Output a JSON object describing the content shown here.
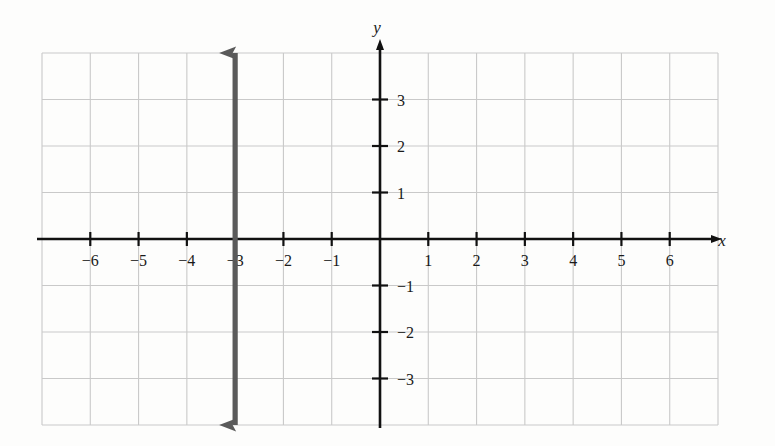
{
  "figure": {
    "kind": "coordinate-plane-graph",
    "background_color": "#fdfdfc",
    "grid_color": "#c9c9c9",
    "axis_color": "#111111",
    "line_color": "#5a5a5a"
  },
  "axes": {
    "x_label": "x",
    "y_label": "y",
    "x_ticks": [
      {
        "value": -6,
        "label": "−6"
      },
      {
        "value": -5,
        "label": "−5"
      },
      {
        "value": -4,
        "label": "−4"
      },
      {
        "value": -3,
        "label": "−3"
      },
      {
        "value": -2,
        "label": "−2"
      },
      {
        "value": -1,
        "label": "−1"
      },
      {
        "value": 1,
        "label": "1"
      },
      {
        "value": 2,
        "label": "2"
      },
      {
        "value": 3,
        "label": "3"
      },
      {
        "value": 4,
        "label": "4"
      },
      {
        "value": 5,
        "label": "5"
      },
      {
        "value": 6,
        "label": "6"
      }
    ],
    "y_ticks": [
      {
        "value": 3,
        "label": "3"
      },
      {
        "value": 2,
        "label": "2"
      },
      {
        "value": 1,
        "label": "1"
      },
      {
        "value": -1,
        "label": "−1"
      },
      {
        "value": -2,
        "label": "−2"
      },
      {
        "value": -3,
        "label": "−3"
      }
    ]
  },
  "chart_data": {
    "type": "line",
    "title": "",
    "xlabel": "x",
    "ylabel": "y",
    "xlim": [
      -7,
      7
    ],
    "ylim": [
      -4,
      4
    ],
    "grid": true,
    "legend": "none",
    "series": [
      {
        "name": "vertical line",
        "equation": "x = -3",
        "orientation": "vertical",
        "x_intercept": -3,
        "y_intercept": null,
        "slope": "undefined",
        "color": "#5a5a5a",
        "arrow_start": {
          "x": -3,
          "y": -4
        },
        "arrow_end": {
          "x": -3,
          "y": 4
        },
        "points": [
          [
            -3,
            -4
          ],
          [
            -3,
            4
          ]
        ]
      }
    ],
    "categories": [],
    "values": []
  }
}
